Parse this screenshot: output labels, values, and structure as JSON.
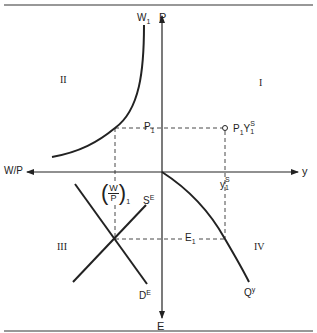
{
  "diagram": {
    "title": "",
    "type": "four-quadrant macroeconomic diagram",
    "axes": {
      "up": "P",
      "right": "y",
      "left": "W/P",
      "down": "E"
    },
    "quadrants": {
      "q1": "I",
      "q2": "II",
      "q3": "III",
      "q4": "IV"
    },
    "curves": {
      "w1": {
        "base": "W",
        "sub": "1"
      },
      "se": {
        "base": "S",
        "sup": "E"
      },
      "de": {
        "base": "D",
        "sup": "E"
      },
      "qy": {
        "base": "Q",
        "sup": "y"
      }
    },
    "points": {
      "p1": {
        "base": "P",
        "sub": "1"
      },
      "p1ys1": {
        "a": "P",
        "a_sub": "1",
        "b": "Y",
        "b_sup": "S",
        "b_sub": "1"
      },
      "ys1": {
        "base": "y",
        "sup": "S",
        "sub": "1"
      },
      "e1": {
        "base": "E",
        "sub": "1"
      },
      "wp1": {
        "num": "W",
        "den": "P",
        "sub": "1",
        "lparen": "(",
        "rparen": ")"
      }
    },
    "colors": {
      "line": "#222222",
      "background": "#ffffff"
    }
  }
}
